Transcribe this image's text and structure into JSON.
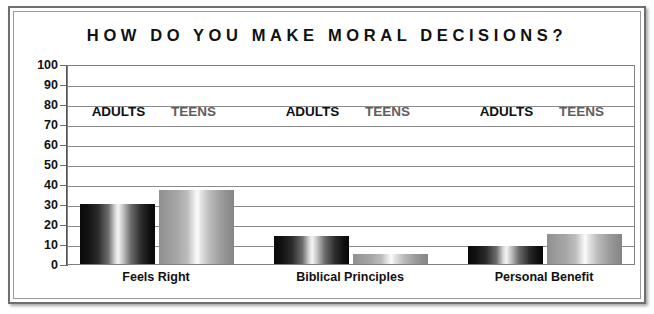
{
  "chart_data": {
    "type": "bar",
    "title": "HOW DO YOU MAKE MORAL DECISIONS?",
    "xlabel": "",
    "ylabel": "",
    "ylim": [
      0,
      100
    ],
    "ytick_labels": [
      "100",
      "90",
      "80",
      "70",
      "60",
      "50",
      "40",
      "30",
      "20",
      "10",
      "0"
    ],
    "ytick_values": [
      100,
      90,
      80,
      70,
      60,
      50,
      40,
      30,
      20,
      10,
      0
    ],
    "grid": true,
    "legend_position": "inline-above-groups",
    "categories": [
      "Feels Right",
      "Biblical Principles",
      "Personal Benefit"
    ],
    "series": [
      {
        "name": "ADULTS",
        "values": [
          30,
          14,
          9
        ]
      },
      {
        "name": "TEENS",
        "values": [
          37,
          5,
          15
        ]
      }
    ],
    "group_labels": [
      {
        "adults": "ADULTS",
        "teens": "TEENS"
      },
      {
        "adults": "ADULTS",
        "teens": "TEENS"
      },
      {
        "adults": "ADULTS",
        "teens": "TEENS"
      }
    ],
    "colors": {
      "adults_bar": "#1a1a1a",
      "teens_bar": "#9a9a9a",
      "gridline": "#8b8b8b",
      "axis": "#555555",
      "text": "#111111",
      "teens_label": "#5e5e5e",
      "frame": "#6f6f6f",
      "background": "#ffffff"
    }
  }
}
